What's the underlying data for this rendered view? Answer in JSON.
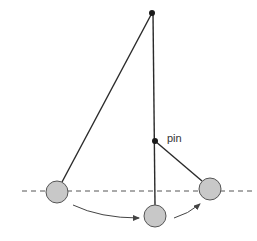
{
  "diagram": {
    "labels": {
      "pin": "pin"
    },
    "colors": {
      "line": "#2a2a2a",
      "bob_fill": "#c8c8c8",
      "bob_stroke": "#555555",
      "dashed": "#555555",
      "arrow": "#444444",
      "pivot": "#1a1a1a"
    },
    "pivot": {
      "x": 152,
      "y": 13
    },
    "pin": {
      "x": 155,
      "y": 141
    },
    "bobs": [
      {
        "name": "left",
        "x": 57,
        "y": 192,
        "r": 11
      },
      {
        "name": "bottom",
        "x": 155,
        "y": 216,
        "r": 11
      },
      {
        "name": "right",
        "x": 210,
        "y": 189,
        "r": 11
      }
    ],
    "reference_line": {
      "y": 191,
      "x1": 22,
      "x2": 252
    }
  }
}
